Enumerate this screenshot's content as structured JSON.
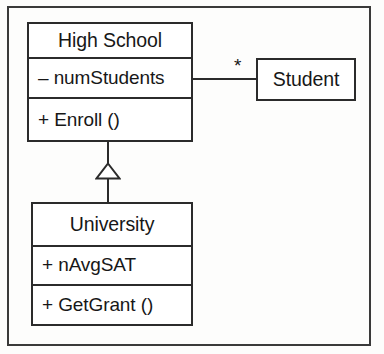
{
  "diagram": {
    "notation": "uml-class-diagram",
    "background_color": "#fdfdfc",
    "line_color": "#2b2b2b",
    "text_color": "#171717"
  },
  "classes": [
    {
      "id": "highschool",
      "name": "High School",
      "attributes": [
        "– numStudents"
      ],
      "operations": [
        "+ Enroll ()"
      ]
    },
    {
      "id": "student",
      "name": "Student",
      "attributes": [],
      "operations": []
    },
    {
      "id": "university",
      "name": "University",
      "attributes": [
        "+ nAvgSAT"
      ],
      "operations": [
        "+ GetGrant ()"
      ]
    }
  ],
  "relationships": [
    {
      "id": "association-highschool-student",
      "type": "association",
      "from": "High School",
      "to": "Student",
      "target_multiplicity": "*"
    },
    {
      "id": "generalization-university-highschool",
      "type": "generalization",
      "from": "University",
      "to": "High School",
      "arrowhead": "hollow-triangle"
    }
  ]
}
